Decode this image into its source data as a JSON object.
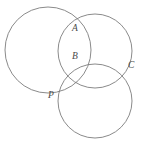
{
  "figure": {
    "background_color": "#ffffff",
    "stroke_color": "#7d7d7d",
    "label_color": "#4a4a4a",
    "width": 146,
    "height": 149
  },
  "labels": {
    "a": "A",
    "b": "B",
    "c": "C",
    "p": "P"
  },
  "chart_data": {
    "type": "diagram",
    "subtype": "circle-geometry",
    "xlim": [
      0,
      146
    ],
    "ylim": [
      0,
      149
    ],
    "grid": false,
    "legend": null,
    "circles": [
      {
        "name": "left-circle",
        "cx": 48,
        "cy": 50,
        "r": 43
      },
      {
        "name": "upper-right-circle",
        "cx": 95,
        "cy": 51,
        "r": 37
      },
      {
        "name": "lower-right-circle",
        "cx": 95,
        "cy": 101,
        "r": 37
      }
    ],
    "points": [
      {
        "label": "A",
        "x": 75,
        "y": 21,
        "label_x": 72,
        "label_y": 24
      },
      {
        "label": "B",
        "x": 85,
        "y": 64,
        "label_x": 72,
        "label_y": 52
      },
      {
        "label": "C",
        "x": 130,
        "y": 66,
        "label_x": 128,
        "label_y": 61
      },
      {
        "label": "P",
        "x": 61,
        "y": 90,
        "label_x": 48,
        "label_y": 91
      }
    ]
  }
}
